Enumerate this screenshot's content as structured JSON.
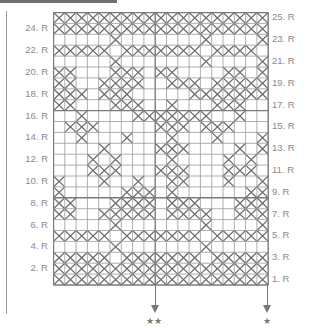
{
  "chart": {
    "columns": 19,
    "rows": 25,
    "cell_w": 11.3,
    "cell_h": 10.9,
    "line_color": "#9a9a9a",
    "x_color": "#6e6e6e",
    "heavy_line_color": "#7a7a7a",
    "center_column_divider": 9,
    "heavy_row_dividers": [
      8,
      16
    ],
    "pattern_bottom_to_top": [
      "1111111111111111111",
      "1111111111111111111",
      "1111101111111011111",
      "0000010000000100000",
      "1111101111111011111",
      "0000010000000100001",
      "1100111110111100111",
      "1100011110111000111",
      "1000001110100000011",
      "1000100100110001001",
      "0001110001110001110",
      "0001010000100001010",
      "0000100001110000101",
      "0010001000100010001",
      "0111000001110111000",
      "0010000111111100100",
      "1100011100100011100",
      "1110111000001111111",
      "1100111100111011111",
      "1100011101100001101",
      "0000010000000100001",
      "1111101111111011110",
      "0000010000000100001",
      "1111111111111111111",
      "1111111111111111111"
    ]
  },
  "labels": {
    "left": [
      "2. R",
      "4. R",
      "6. R",
      "8. R",
      "10. R",
      "12. R",
      "14. R",
      "16. R",
      "18. R",
      "20. R",
      "22. R",
      "24. R"
    ],
    "right": [
      "1. R",
      "3. R",
      "5. R",
      "7. R",
      "9. R",
      "11. R",
      "13. R",
      "15. R",
      "17. R",
      "19. R",
      "21. R",
      "23. R",
      "25. R"
    ]
  },
  "markers": {
    "center_star": "★★",
    "right_star": "★"
  }
}
